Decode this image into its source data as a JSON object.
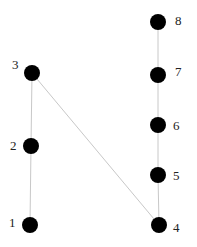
{
  "diagram": {
    "type": "graph",
    "colors": {
      "node": "#000000",
      "edge": "#c8c8c8",
      "label": "#222222",
      "background": "#ffffff"
    },
    "node_radius": 8,
    "nodes": [
      {
        "id": "1",
        "label": "1",
        "cx": 30,
        "cy": 225,
        "lx": 9,
        "ly": 227
      },
      {
        "id": "2",
        "label": "2",
        "cx": 31,
        "cy": 146,
        "lx": 10,
        "ly": 150
      },
      {
        "id": "3",
        "label": "3",
        "cx": 32,
        "cy": 73,
        "lx": 12,
        "ly": 69
      },
      {
        "id": "4",
        "label": "4",
        "cx": 159,
        "cy": 225,
        "lx": 173,
        "ly": 232
      },
      {
        "id": "5",
        "label": "5",
        "cx": 158,
        "cy": 175,
        "lx": 173,
        "ly": 180
      },
      {
        "id": "6",
        "label": "6",
        "cx": 158,
        "cy": 125,
        "lx": 173,
        "ly": 130
      },
      {
        "id": "7",
        "label": "7",
        "cx": 158,
        "cy": 75,
        "lx": 175,
        "ly": 76
      },
      {
        "id": "8",
        "label": "8",
        "cx": 158,
        "cy": 22,
        "lx": 175,
        "ly": 25
      }
    ],
    "edges": [
      {
        "from": "1",
        "to": "2"
      },
      {
        "from": "2",
        "to": "3"
      },
      {
        "from": "3",
        "to": "4"
      },
      {
        "from": "4",
        "to": "5"
      },
      {
        "from": "5",
        "to": "6"
      },
      {
        "from": "6",
        "to": "7"
      },
      {
        "from": "7",
        "to": "8"
      }
    ]
  }
}
